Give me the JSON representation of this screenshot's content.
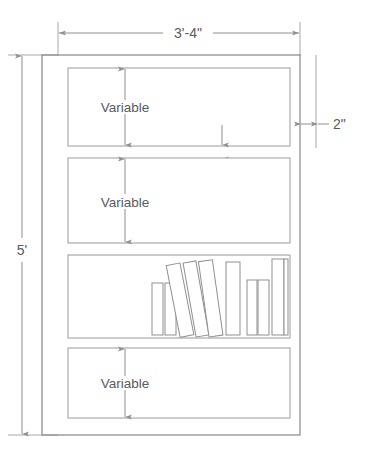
{
  "drawing": {
    "type": "bookcase-elevation",
    "title_dimension_top": "3'-4\"",
    "dimension_left": "5'",
    "dimension_shelf_right": "2\"",
    "dimension_shelf_inner": "2\"",
    "colors": {
      "line": "#8f8f8f",
      "line_light": "#a8a8a8",
      "text": "#5a5a5a",
      "background": "#ffffff"
    },
    "frame": {
      "x": 42,
      "y": 55,
      "width": 258,
      "height": 380
    },
    "compartments": [
      {
        "name": "shelf-compartment-1",
        "label": "Variable",
        "x": 68,
        "y": 68,
        "width": 222,
        "height": 78,
        "has_books": false
      },
      {
        "name": "shelf-compartment-2",
        "label": "Variable",
        "x": 68,
        "y": 158,
        "width": 222,
        "height": 85,
        "has_books": false
      },
      {
        "name": "shelf-compartment-3",
        "label": "",
        "x": 68,
        "y": 255,
        "width": 222,
        "height": 83,
        "has_books": true
      },
      {
        "name": "shelf-compartment-4",
        "label": "Variable",
        "x": 68,
        "y": 348,
        "width": 222,
        "height": 70,
        "has_books": false
      }
    ],
    "books": [
      {
        "name": "book-1",
        "style": "upright",
        "x": 152,
        "y": 283,
        "width": 11,
        "height": 52
      },
      {
        "name": "book-2",
        "style": "upright",
        "x": 165,
        "y": 283,
        "width": 11,
        "height": 52
      },
      {
        "name": "book-3",
        "style": "tilted",
        "x": 180,
        "y": 262,
        "width": 14,
        "height": 73,
        "tilt": -11
      },
      {
        "name": "book-4",
        "style": "tilted",
        "x": 196,
        "y": 260,
        "width": 13,
        "height": 75,
        "tilt": -10
      },
      {
        "name": "book-5",
        "style": "tilted",
        "x": 209,
        "y": 259,
        "width": 14,
        "height": 76,
        "tilt": -8
      },
      {
        "name": "book-6",
        "style": "upright",
        "x": 226,
        "y": 262,
        "width": 14,
        "height": 73
      },
      {
        "name": "book-7",
        "style": "upright",
        "x": 247,
        "y": 280,
        "width": 10,
        "height": 55
      },
      {
        "name": "book-8",
        "style": "upright",
        "x": 258,
        "y": 280,
        "width": 11,
        "height": 55
      },
      {
        "name": "book-9",
        "style": "upright",
        "x": 272,
        "y": 259,
        "width": 12,
        "height": 76
      },
      {
        "name": "book-10",
        "style": "upright",
        "x": 284,
        "y": 259,
        "width": 4,
        "height": 76
      }
    ]
  }
}
